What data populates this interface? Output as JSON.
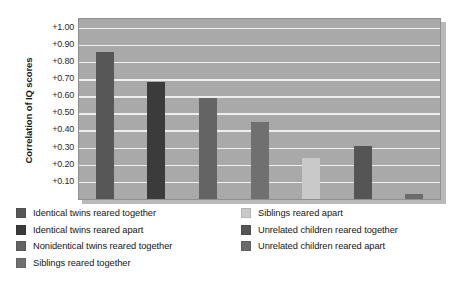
{
  "chart_data": {
    "type": "bar",
    "title": "",
    "xlabel": "",
    "ylabel": "Correlation of IQ scores",
    "ylim": [
      0,
      1.05
    ],
    "grid": true,
    "legend_position": "bottom",
    "tick_labels": [
      "+1.00",
      "+0.90",
      "+0.80",
      "+0.70",
      "+0.60",
      "+0.50",
      "+0.40",
      "+0.30",
      "+0.20",
      "+0.10"
    ],
    "tick_values": [
      1.0,
      0.9,
      0.8,
      0.7,
      0.6,
      0.5,
      0.4,
      0.3,
      0.2,
      0.1
    ],
    "categories": [
      "Identical twins reared together",
      "Identical twins reared apart",
      "Nonidentical twins reared together",
      "Siblings reared together",
      "Siblings reared apart",
      "Unrelated children reared together",
      "Unrelated children reared apart"
    ],
    "values": [
      0.86,
      0.68,
      0.59,
      0.45,
      0.24,
      0.31,
      0.03
    ],
    "colors": [
      "#575757",
      "#3b3b3b",
      "#646464",
      "#707070",
      "#c9c9c9",
      "#555555",
      "#6b6b6b"
    ],
    "plot_background": "#a9a9a9",
    "gridline_color": "#eeeeee"
  },
  "legend": {
    "left_column": [
      {
        "label": "Identical twins reared together",
        "color": "#575757"
      },
      {
        "label": "Identical twins reared apart",
        "color": "#3b3b3b"
      },
      {
        "label": "Nonidentical twins reared together",
        "color": "#646464"
      },
      {
        "label": "Siblings reared together",
        "color": "#707070"
      }
    ],
    "right_column": [
      {
        "label": "Siblings reared apart",
        "color": "#c9c9c9"
      },
      {
        "label": "Unrelated children reared together",
        "color": "#555555"
      },
      {
        "label": "Unrelated children reared apart",
        "color": "#6b6b6b"
      }
    ]
  }
}
